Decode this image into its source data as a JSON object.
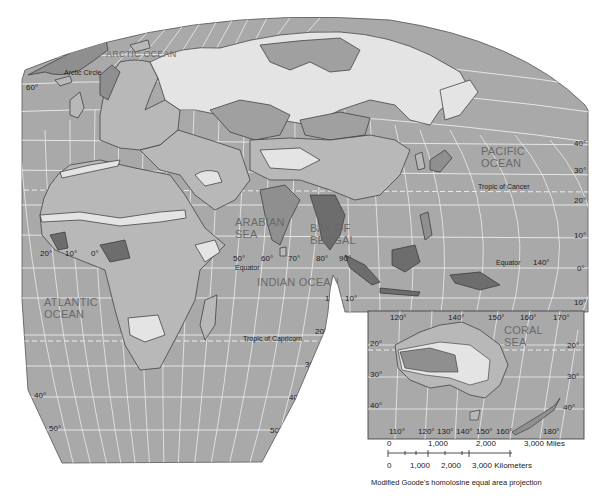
{
  "map": {
    "projection_caption": "Modified Goode's homolosine equal area projection",
    "colors": {
      "ocean": "#a9a9a9",
      "grid": "#ececec",
      "land_light": "#e4e4e4",
      "land_mid": "#b8b8b8",
      "land_dark": "#8f8f8f",
      "land_darkest": "#6d6d6d",
      "border": "#333333"
    },
    "ocean_labels": {
      "arctic": "ARCTIC OCEAN",
      "pacific_1": "PACIFIC",
      "pacific_2": "OCEAN",
      "arabian_1": "ARABIAN",
      "arabian_2": "SEA",
      "bengal_1": "BAY OF",
      "bengal_2": "BENGAL",
      "indian": "INDIAN OCEAN",
      "atlantic_1": "ATLANTIC",
      "atlantic_2": "OCEAN",
      "coral_1": "CORAL",
      "coral_2": "SEA"
    },
    "line_labels": {
      "arctic_circle": "Arctic Circle",
      "tropic_cancer": "Tropic of Cancer",
      "equator_west": "Equator",
      "equator_east": "Equator",
      "tropic_capricorn": "Tropic of Capricorn"
    },
    "latitude_labels": {
      "left_60": "60°",
      "right_40": "40°",
      "right_30": "30°",
      "right_20": "20°",
      "right_10": "10°",
      "right_0": "0°",
      "right_m10": "10°",
      "center_10a": "10°",
      "center_10b": "10°",
      "south_20": "20°",
      "south_30": "30°",
      "south_40_right": "40°",
      "south_50_right": "50°",
      "south_40_left": "40°",
      "south_50_left": "50°"
    },
    "longitude_labels": {
      "w20": "20°",
      "w10": "10°",
      "e0": "0°",
      "e50": "50°",
      "e60": "60°",
      "e70": "70°",
      "e80": "80°",
      "e90": "90°",
      "e140": "140°"
    },
    "inset": {
      "top_lons": [
        "120°",
        "140°",
        "150°",
        "160°",
        "170°"
      ],
      "bottom_lons": [
        "110°",
        "120°",
        "130°",
        "140°",
        "150°",
        "160°",
        "180°"
      ],
      "left_lats": [
        "20°",
        "30°",
        "40°"
      ],
      "right_lats": [
        "20°",
        "30°",
        "40°"
      ]
    },
    "scale": {
      "miles_ticks": [
        "0",
        "1,000",
        "2,000",
        "3,000 Miles"
      ],
      "km_ticks": [
        "0",
        "1,000",
        "2,000",
        "3,000 Kilometers"
      ]
    }
  }
}
